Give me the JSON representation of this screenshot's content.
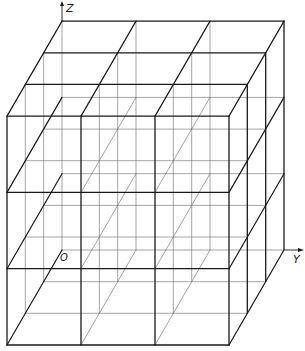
{
  "diagram": {
    "grid": {
      "nx": 3,
      "ny": 3,
      "nz": 3
    },
    "geometry": {
      "front_origin": [
        7,
        345
      ],
      "cell_width": 74,
      "cell_height": 76.3,
      "depth_step": [
        18.33,
        -31.67
      ]
    },
    "axes": {
      "z_label": "Z",
      "y_label": "Y",
      "origin_label": "O"
    },
    "colors": {
      "stroke_heavy": "#1a1a1a",
      "stroke_light": "#6a6a6a",
      "background": "#ffffff"
    }
  }
}
